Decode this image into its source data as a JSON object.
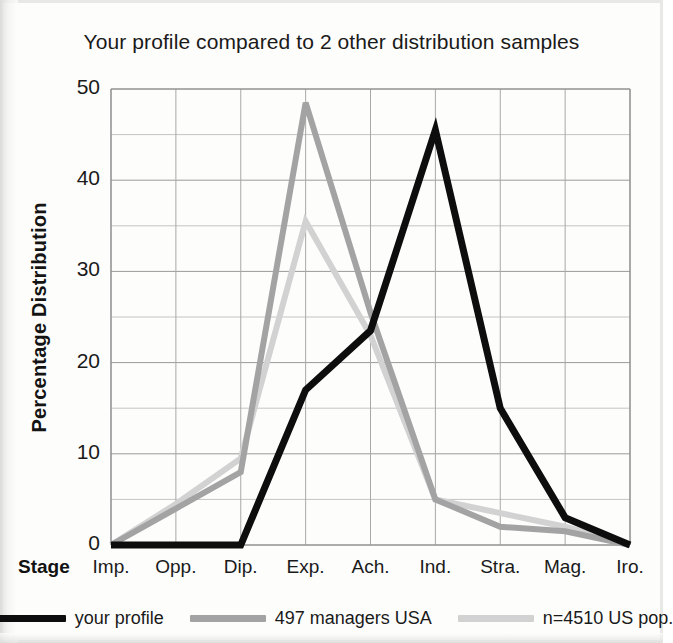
{
  "chart_data": {
    "type": "line",
    "title": "Your profile compared to 2 other distribution samples",
    "xlabel": "Stage",
    "ylabel": "Percentage Distribution",
    "categories": [
      "Imp.",
      "Opp.",
      "Dip.",
      "Exp.",
      "Ach.",
      "Ind.",
      "Stra.",
      "Mag.",
      "Iro."
    ],
    "ylim": [
      0,
      50
    ],
    "yticks": [
      0,
      10,
      20,
      30,
      40,
      50
    ],
    "ytick_labels": [
      "0",
      "10",
      "20",
      "30",
      "40",
      "50"
    ],
    "minor_gridline_step": 5,
    "grid": true,
    "legend_position": "bottom",
    "series": [
      {
        "name": "your profile",
        "color": "#0d0d0d",
        "values": [
          0,
          0,
          0,
          17,
          23.5,
          45.5,
          15,
          3,
          0
        ]
      },
      {
        "name": "497 managers USA",
        "color": "#a3a3a3",
        "values": [
          0,
          4,
          8,
          48.5,
          25.5,
          5,
          2,
          1.5,
          0
        ]
      },
      {
        "name": "n=4510 US pop.",
        "color": "#d2d2d2",
        "values": [
          0,
          4.5,
          9.5,
          35.5,
          23,
          5,
          3.5,
          2,
          0
        ]
      }
    ]
  },
  "axis": {
    "y_title": "Percentage Distribution",
    "x_title": "Stage"
  }
}
